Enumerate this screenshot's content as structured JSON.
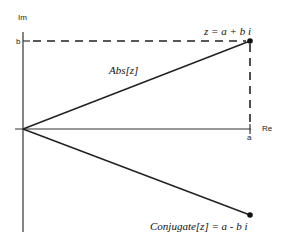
{
  "diagram": {
    "axes": {
      "x_label": "Re",
      "y_label": "Im",
      "x_tick_label": "a",
      "y_tick_label": "b"
    },
    "labels": {
      "point_z": "z = a + b i",
      "modulus": "Abs[z]",
      "conjugate": "Conjugate[z] = a - b i"
    },
    "geometry": {
      "origin": [
        23,
        129
      ],
      "z_point": [
        250,
        41
      ],
      "conjugate_point": [
        250,
        215
      ]
    },
    "colors": {
      "line": "#222222",
      "background": "#ffffff"
    }
  }
}
